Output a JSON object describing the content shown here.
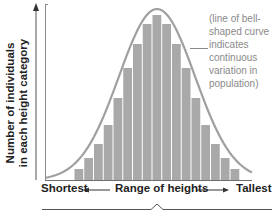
{
  "figure": {
    "y_axis_label_line1": "Number of individuals",
    "y_axis_label_line2": "in each height category",
    "x_axis_left_label": "Shortest",
    "x_axis_center_label": "Range of heights",
    "x_axis_right_label": "Tallest",
    "annotation": "(line of bell-shaped curve indicates continuous variation in population)",
    "colors": {
      "bar_fill": "#a9a9a9",
      "bar_gap": "#e8e8e8",
      "curve": "#a0a0a0",
      "axis": "#6f6f6f",
      "text": "#222222",
      "annotation_text": "#8a8a8a"
    }
  },
  "chart_data": {
    "type": "bar",
    "title": "",
    "xlabel": "Range of heights (Shortest to Tallest)",
    "ylabel": "Number of individuals in each height category",
    "categories": [
      "1",
      "2",
      "3",
      "4",
      "5",
      "6",
      "7",
      "8",
      "9",
      "10",
      "11",
      "12",
      "13",
      "14",
      "15",
      "16",
      "17"
    ],
    "values": [
      11,
      22,
      36,
      55,
      82,
      112,
      136,
      156,
      165,
      156,
      136,
      112,
      82,
      55,
      36,
      22,
      11
    ],
    "overlay": "bell-shaped normal curve",
    "annotation": "(line of bell-shaped curve indicates continuous variation in population)",
    "grid": false,
    "legend": "none",
    "ylim": [
      0,
      175
    ]
  }
}
